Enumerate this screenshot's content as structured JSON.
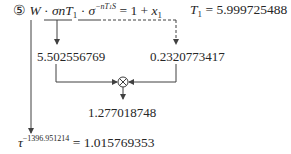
{
  "equation": {
    "step_marker": "⑤",
    "W": "W",
    "dot1": "·",
    "sigma_nT": "σnT",
    "sub_1": "1",
    "dot2": "·",
    "sigma": "σ",
    "exponent": "−nT",
    "exp_sub": "1",
    "exp_tail": "S",
    "equals_rhs": "= 1 + ",
    "x": "x",
    "x_sub": "1"
  },
  "t1_assignment": {
    "T": "T",
    "sub": "1",
    "value_text": "= 5.999725488"
  },
  "values": {
    "left_value": "5.502556769",
    "right_value": "0.2320773417",
    "product_value": "1.277018748",
    "multiply_symbol": "⊗"
  },
  "result": {
    "tau": "τ",
    "exponent": "−1396.951214",
    "rhs": "= 1.015769353"
  },
  "colors": {
    "text": "#262626",
    "lines": "#404040"
  }
}
